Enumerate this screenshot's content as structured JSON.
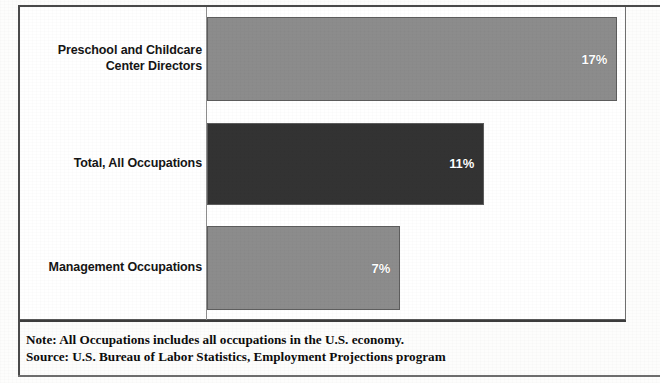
{
  "chart_data": {
    "type": "bar",
    "orientation": "horizontal",
    "title": "",
    "subtitle": "",
    "xlabel": "",
    "ylabel": "",
    "categories": [
      "Preschool and Childcare Center Directors",
      "Total, All Occupations",
      "Management Occupations"
    ],
    "values": [
      17,
      11,
      7
    ],
    "value_labels": [
      "17%",
      "11%",
      "7%"
    ],
    "bar_colors": [
      "#8c8c8c",
      "#333333",
      "#8c8c8c"
    ],
    "xlim": [
      0,
      17
    ],
    "grid": false,
    "legend": null,
    "axis_tick_labels": [],
    "bars": [
      {
        "label_line1": "Preschool and Childcare",
        "label_line2": "Center Directors",
        "value": 17,
        "value_label": "17%",
        "color": "#8c8c8c",
        "width_px": 410
      },
      {
        "label_line1": "Total, All Occupations",
        "label_line2": "",
        "value": 11,
        "value_label": "11%",
        "color": "#333333",
        "width_px": 277
      },
      {
        "label_line1": "Management Occupations",
        "label_line2": "",
        "value": 7,
        "value_label": "7%",
        "color": "#8c8c8c",
        "width_px": 193
      }
    ]
  },
  "footer": {
    "note": "Note: All Occupations includes all occupations in the U.S. economy.",
    "source": "Source: U.S. Bureau of Labor Statistics, Employment Projections program"
  }
}
